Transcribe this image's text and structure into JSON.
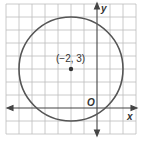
{
  "diagram": {
    "type": "coordinate-plane-circle",
    "center_label": "(−2, 3)",
    "center": [
      -2,
      3
    ],
    "radius": 4,
    "x_axis_label": "x",
    "y_axis_label": "y",
    "origin_label": "O",
    "colors": {
      "grid": "#b8b8b8",
      "axis": "#444444",
      "circle": "#555555",
      "point": "#333333"
    }
  }
}
